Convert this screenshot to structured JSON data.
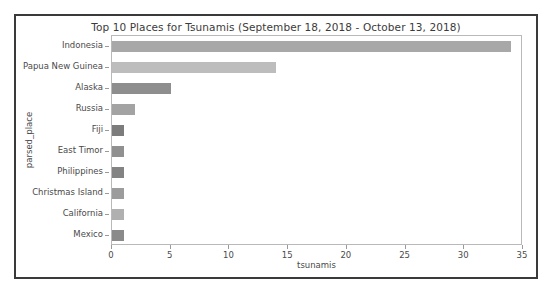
{
  "chart_data": {
    "type": "bar",
    "orientation": "horizontal",
    "title": "Top 10 Places for Tsunamis (September 18, 2018 - October 13, 2018)",
    "xlabel": "tsunamis",
    "ylabel": "parsed_place",
    "categories": [
      "Indonesia",
      "Papua New Guinea",
      "Alaska",
      "Russia",
      "Fiji",
      "East Timor",
      "Philippines",
      "Christmas Island",
      "California",
      "Mexico"
    ],
    "values": [
      34,
      14,
      5,
      2,
      1,
      1,
      1,
      1,
      1,
      1
    ],
    "bar_colors": [
      "#a8a8a8",
      "#bdbdbd",
      "#8e8e8e",
      "#a3a3a3",
      "#7c7c7c",
      "#909090",
      "#838383",
      "#9c9c9c",
      "#b0b0b0",
      "#8a8a8a"
    ],
    "xlim": [
      0,
      35
    ],
    "xticks": [
      0,
      5,
      10,
      15,
      20,
      25,
      30,
      35
    ],
    "xtick_labels": [
      "0",
      "5",
      "10",
      "15",
      "20",
      "25",
      "30",
      "35"
    ],
    "grid": false,
    "legend": false,
    "axes_edge_color": "#b9b9b9",
    "frame_color": "#3a3a3a",
    "text_color": "#4a4a4a",
    "background": "#ffffff"
  }
}
